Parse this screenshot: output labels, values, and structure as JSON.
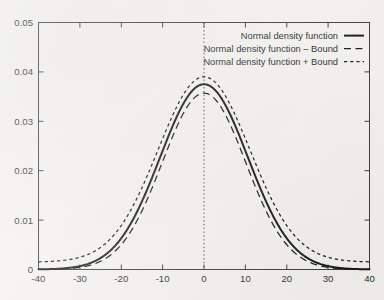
{
  "chart_data": {
    "type": "line",
    "title": "",
    "subtitle": "",
    "xlabel": "",
    "ylabel": "",
    "xlim": [
      -40,
      40
    ],
    "ylim": [
      0,
      0.05
    ],
    "grid": false,
    "legend_position": "top-right",
    "x_ticks": [
      -40,
      -30,
      -20,
      -10,
      0,
      10,
      20,
      30,
      40
    ],
    "x_tick_labels": [
      "-40",
      "-30",
      "-20",
      "-10",
      "0",
      "10",
      "20",
      "30",
      "40"
    ],
    "y_ticks": [
      0,
      0.01,
      0.02,
      0.03,
      0.04,
      0.05
    ],
    "y_tick_labels": [
      "0",
      "0.01",
      "0.02",
      "0.03",
      "0.04",
      "0.05"
    ],
    "annotations": [
      {
        "name": "zero-reference-line",
        "type": "vline",
        "x": 0,
        "style": "dotted"
      }
    ],
    "series": [
      {
        "name": "Normal density function",
        "style": "solid",
        "peak_x": 0,
        "peak_y": 0.0375,
        "sigma": 10.6,
        "offset": 0,
        "x": [
          -40,
          -36,
          -32,
          -28,
          -24,
          -20,
          -16,
          -12,
          -8,
          -4,
          0,
          4,
          8,
          12,
          16,
          20,
          24,
          28,
          32,
          36,
          40
        ],
        "values": [
          4e-05,
          0.00014,
          0.00045,
          0.00123,
          0.0029,
          0.00591,
          0.01043,
          0.01596,
          0.02118,
          0.02429,
          0.0375,
          0.02429,
          0.02118,
          0.01596,
          0.01043,
          0.00591,
          0.0029,
          0.00123,
          0.00045,
          0.00014,
          4e-05
        ]
      },
      {
        "name": "Normal density function – Bound",
        "style": "dashed",
        "peak_x": 0,
        "peak_y": 0.0357,
        "sigma": 10.1,
        "offset": 0,
        "x": [
          -40,
          -36,
          -32,
          -28,
          -24,
          -20,
          -16,
          -12,
          -8,
          -4,
          0,
          4,
          8,
          12,
          16,
          20,
          24,
          28,
          32,
          36,
          40
        ],
        "values": [
          1e-05,
          6e-05,
          0.00023,
          0.00072,
          0.00192,
          0.00437,
          0.00852,
          0.01423,
          0.02037,
          0.02504,
          0.0357,
          0.02504,
          0.02037,
          0.01423,
          0.00852,
          0.00437,
          0.00192,
          0.00072,
          0.00023,
          6e-05,
          1e-05
        ]
      },
      {
        "name": "Normal density function + Bound",
        "style": "dotted",
        "peak_x": 0,
        "peak_y": 0.039,
        "sigma": 11.1,
        "offset": 0.0015,
        "x": [
          -40,
          -36,
          -32,
          -28,
          -24,
          -20,
          -16,
          -12,
          -8,
          -4,
          0,
          4,
          8,
          12,
          16,
          20,
          24,
          28,
          32,
          36,
          40
        ],
        "values": [
          0.00165,
          0.00185,
          0.00232,
          0.00336,
          0.00538,
          0.00901,
          0.01456,
          0.02184,
          0.02916,
          0.0343,
          0.039,
          0.0343,
          0.02916,
          0.02184,
          0.01456,
          0.00901,
          0.00538,
          0.00336,
          0.00232,
          0.00185,
          0.00165
        ]
      }
    ]
  },
  "legend": {
    "items": [
      {
        "label": "Normal density function",
        "style": "solid"
      },
      {
        "label": "Normal density function – Bound",
        "style": "dashed"
      },
      {
        "label": "Normal density function + Bound",
        "style": "dotted"
      }
    ]
  },
  "colors": {
    "ink": "#141414",
    "axis": "#3a3a3a",
    "background": "#f3f2ef"
  }
}
